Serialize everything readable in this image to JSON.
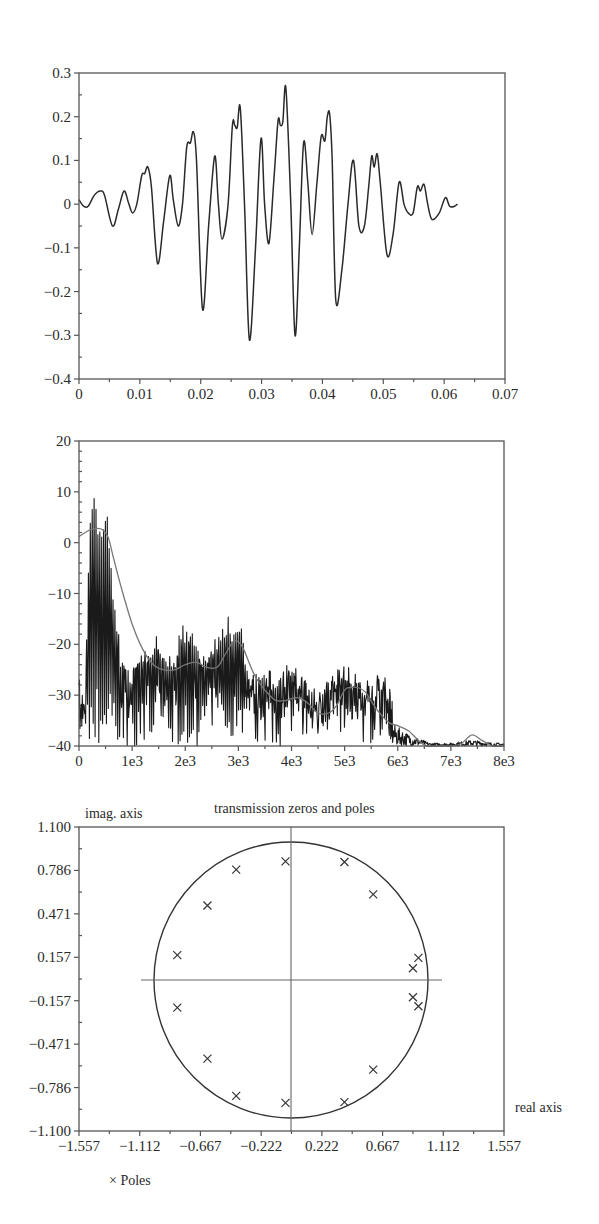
{
  "chart_data": [
    {
      "type": "line",
      "title": "",
      "xlabel": "",
      "ylabel": "",
      "xlim": [
        0,
        0.07
      ],
      "ylim": [
        -0.4,
        0.3
      ],
      "xticks": [
        "0",
        "0.01",
        "0.02",
        "0.03",
        "0.04",
        "0.05",
        "0.06",
        "0.07"
      ],
      "yticks": [
        "0.3",
        "0.2",
        "0.1",
        "0",
        "−0.1",
        "−0.2",
        "−0.3",
        "−0.4"
      ],
      "grid": false,
      "series": [
        {
          "name": "signal",
          "color": "#2a2a2a",
          "x": [
            0,
            0.0008,
            0.0015,
            0.0025,
            0.0035,
            0.0042,
            0.0055,
            0.0065,
            0.0074,
            0.0082,
            0.0088,
            0.0095,
            0.0103,
            0.0108,
            0.0113,
            0.0119,
            0.0129,
            0.0139,
            0.0149,
            0.0155,
            0.0163,
            0.017,
            0.0177,
            0.0183,
            0.0188,
            0.0193,
            0.0203,
            0.0213,
            0.0223,
            0.0229,
            0.0235,
            0.0245,
            0.0252,
            0.0256,
            0.026,
            0.0265,
            0.0272,
            0.028,
            0.029,
            0.0299,
            0.0305,
            0.0312,
            0.032,
            0.0327,
            0.0331,
            0.0335,
            0.034,
            0.0348,
            0.0355,
            0.0362,
            0.0369,
            0.0376,
            0.0383,
            0.0391,
            0.0398,
            0.0404,
            0.0408,
            0.0412,
            0.0416,
            0.0422,
            0.0432,
            0.0442,
            0.0451,
            0.046,
            0.0469,
            0.0476,
            0.0481,
            0.0485,
            0.049,
            0.0495,
            0.0506,
            0.0516,
            0.0526,
            0.0534,
            0.0541,
            0.0549,
            0.0556,
            0.0561,
            0.0567,
            0.0573,
            0.058,
            0.0592,
            0.0602,
            0.0609,
            0.0617,
            0.0622
          ],
          "y": [
            0.01,
            -0.005,
            -0.005,
            0.02,
            0.03,
            0.02,
            -0.05,
            -0.01,
            0.03,
            0.0,
            -0.02,
            0.0,
            0.065,
            0.07,
            0.085,
            0.04,
            -0.135,
            -0.04,
            0.065,
            0.01,
            -0.05,
            0.0,
            0.13,
            0.14,
            0.165,
            0.1,
            -0.24,
            -0.05,
            0.11,
            0.0,
            -0.08,
            0.0,
            0.18,
            0.18,
            0.175,
            0.22,
            0.0,
            -0.31,
            -0.1,
            0.15,
            0.0,
            -0.09,
            0.05,
            0.19,
            0.18,
            0.19,
            0.265,
            0.0,
            -0.3,
            -0.1,
            0.14,
            0.05,
            -0.07,
            0.05,
            0.155,
            0.145,
            0.2,
            0.205,
            0.1,
            -0.22,
            -0.15,
            0.0,
            0.1,
            -0.05,
            -0.05,
            0.04,
            0.11,
            0.085,
            0.115,
            0.05,
            -0.115,
            -0.07,
            0.05,
            0.0,
            -0.02,
            -0.02,
            0.04,
            0.03,
            0.045,
            0.0,
            -0.035,
            -0.02,
            0.015,
            -0.005,
            -0.005,
            0.0
          ]
        }
      ]
    },
    {
      "type": "line",
      "title": "",
      "xlabel": "",
      "ylabel": "",
      "xlim": [
        0,
        8000
      ],
      "ylim": [
        -40,
        20
      ],
      "xticks": [
        "0",
        "1e3",
        "2e3",
        "3e3",
        "4e3",
        "5e3",
        "6e3",
        "7e3",
        "8e3"
      ],
      "yticks": [
        "20",
        "10",
        "0",
        "−10",
        "−20",
        "−30",
        "−40"
      ],
      "grid": false,
      "series": [
        {
          "name": "spectrum (raw, dB)",
          "color": "#1a1a1a",
          "peaks_x": [
            0,
            100,
            200,
            280,
            360,
            450,
            540,
            640,
            770,
            900,
            1050,
            1300,
            1450,
            1600,
            1780,
            1950,
            2100,
            2300,
            2450,
            2650,
            2800,
            2900,
            3000,
            3150,
            3300,
            3550,
            3750,
            3900,
            4100,
            4250,
            4450,
            4700,
            4950,
            5100,
            5300,
            5500,
            5650,
            5750,
            5850,
            6200,
            6600,
            7000,
            7400,
            7800,
            8000
          ],
          "peaks_y": [
            -28,
            -33,
            6.5,
            12.5,
            4,
            5,
            6.5,
            -7.5,
            -20,
            -25,
            -24,
            -20,
            -17.5,
            -21,
            -22,
            -15.5,
            -16.5,
            -21,
            -21,
            -16,
            -14.5,
            -16,
            -13.5,
            -22,
            -27,
            -25.5,
            -27,
            -24,
            -25,
            -27,
            -32,
            -27,
            -23.5,
            -25,
            -28,
            -30,
            -25,
            -25,
            -36,
            -38,
            -39.5,
            -39.5,
            -39,
            -39.5,
            -40
          ]
        },
        {
          "name": "spectral envelope (smoothed)",
          "color": "#777777",
          "x": [
            0,
            200,
            350,
            450,
            550,
            650,
            800,
            1000,
            1200,
            1400,
            1600,
            1800,
            2000,
            2200,
            2400,
            2600,
            2750,
            2900,
            3000,
            3100,
            3300,
            3500,
            3700,
            3900,
            4100,
            4300,
            4500,
            4700,
            4850,
            5000,
            5100,
            5250,
            5400,
            5550,
            5700,
            5850,
            6000,
            6200,
            6400,
            6550,
            6750,
            7000,
            7200,
            7400,
            7600,
            7800,
            8000
          ],
          "y": [
            1.2,
            2.5,
            2.8,
            2.5,
            1,
            -3,
            -9,
            -16,
            -21,
            -24,
            -25,
            -25,
            -24,
            -23.5,
            -24.5,
            -24.5,
            -22,
            -19.5,
            -19.5,
            -21,
            -26,
            -29,
            -31,
            -31,
            -30.5,
            -31.5,
            -33.5,
            -33.5,
            -32,
            -29,
            -28.5,
            -28.5,
            -29.5,
            -32,
            -34,
            -35.5,
            -36,
            -37,
            -39,
            -40,
            -40,
            -40,
            -39.5,
            -37.8,
            -39,
            -40,
            -40
          ]
        }
      ]
    },
    {
      "type": "scatter",
      "title": "transmission zeros and poles",
      "xlabel": "real axis",
      "ylabel": "imag. axis",
      "xlim": [
        -1.557,
        1.557
      ],
      "ylim": [
        -1.1,
        1.1
      ],
      "xticks": [
        "−1.557",
        "−1.112",
        "−0.667",
        "−0.222",
        "0.222",
        "0.667",
        "1.112",
        "1.557"
      ],
      "yticks": [
        "1.100",
        "0.786",
        "0.471",
        "0.157",
        "−0.157",
        "−0.471",
        "−0.786",
        "−1.100"
      ],
      "grid": false,
      "legend": [
        {
          "marker": "×",
          "label": "Poles"
        }
      ],
      "unit_circle": {
        "radius": 1.0,
        "color": "#333333"
      },
      "axes_lines": {
        "horizontal_x": [
          -1.1,
          1.1
        ],
        "vertical_y": [
          -1.1,
          1.1
        ]
      },
      "series": [
        {
          "name": "Poles",
          "marker": "x",
          "points": [
            [
              -0.04,
              0.86
            ],
            [
              0.39,
              0.855
            ],
            [
              0.6,
              0.62
            ],
            [
              -0.4,
              0.8
            ],
            [
              -0.61,
              0.54
            ],
            [
              -0.83,
              0.18
            ],
            [
              0.93,
              0.16
            ],
            [
              0.89,
              0.085
            ],
            [
              -0.83,
              -0.2
            ],
            [
              0.89,
              -0.125
            ],
            [
              0.93,
              -0.19
            ],
            [
              -0.61,
              -0.57
            ],
            [
              0.6,
              -0.65
            ],
            [
              -0.4,
              -0.84
            ],
            [
              -0.04,
              -0.89
            ],
            [
              0.39,
              -0.885
            ]
          ]
        }
      ]
    }
  ],
  "labels": {
    "chart3_title": "transmission zeros and poles",
    "chart3_ylabel": "imag. axis",
    "chart3_xlabel": "real axis",
    "chart3_legend": "× Poles"
  }
}
